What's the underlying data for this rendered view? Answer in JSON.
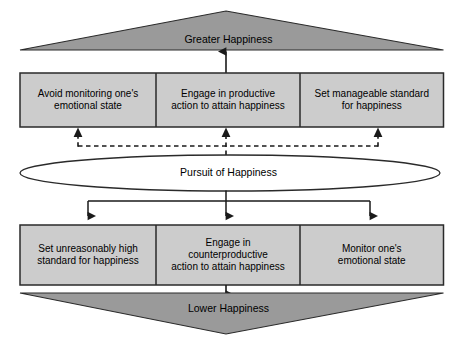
{
  "diagram": {
    "title_top": "Greater Happiness",
    "title_bottom": "Lower Happiness",
    "center_node": "Pursuit of Happiness",
    "colors": {
      "triangle_fill": "#9a9a9a",
      "box_fill": "#cccccc",
      "stroke": "#1a1a1a",
      "ellipse_fill": "#ffffff",
      "text": "#000000",
      "background": "#ffffff"
    },
    "top_outcome": {
      "label": "Greater Happiness"
    },
    "bottom_outcome": {
      "label": "Lower Happiness"
    },
    "adaptive_boxes": [
      {
        "label": "Avoid monitoring one's\nemotional state"
      },
      {
        "label": "Engage in productive\naction to attain happiness"
      },
      {
        "label": "Set manageable standard\nfor happiness"
      }
    ],
    "maladaptive_boxes": [
      {
        "label": "Set unreasonably high\nstandard for happiness"
      },
      {
        "label": "Engage in\ncounterproductive\naction to attain happiness"
      },
      {
        "label": "Monitor one's\nemotional state"
      }
    ],
    "connectors": {
      "adaptive_to_greater": "solid-up-arrow",
      "pursuit_to_adaptive": "dashed-up-arrows",
      "pursuit_to_maladaptive": "solid-down-arrows",
      "maladaptive_to_lower": "solid-down-arrow"
    }
  }
}
